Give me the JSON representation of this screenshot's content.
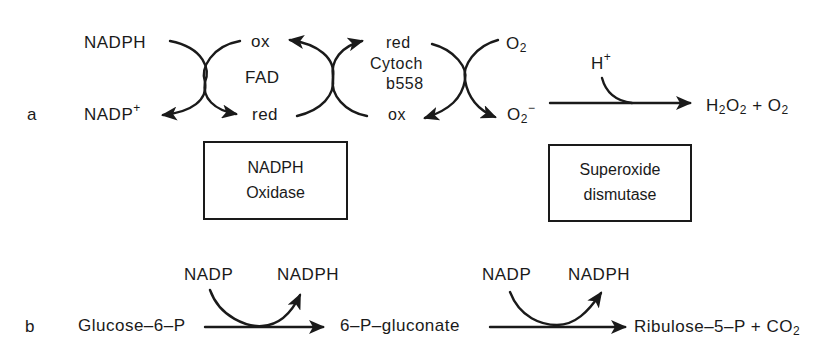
{
  "panel_a": {
    "label": "a",
    "nadph": "NADPH",
    "nadp_plus": "NADP",
    "nadp_plus_sup": "+",
    "fad": {
      "ox": "ox",
      "name": "FAD",
      "red": "red"
    },
    "cytochrome": {
      "red": "red",
      "name_line1": "Cytoch",
      "name_line2": "b558",
      "ox": "ox"
    },
    "o2": "O",
    "o2_sub": "2",
    "superoxide": "O",
    "superoxide_sub": "2",
    "superoxide_sup": "−",
    "h_plus": "H",
    "h_plus_sup": "+",
    "products": {
      "h": "H",
      "h_sub": "2",
      "o": "O",
      "o_sub": "2",
      "plus": "+",
      "o2": "O",
      "o2_sub": "2"
    },
    "enzyme_boxes": [
      {
        "line1": "NADPH",
        "line2": "Oxidase"
      },
      {
        "line1": "Superoxide",
        "line2": "dismutase"
      }
    ]
  },
  "panel_b": {
    "label": "b",
    "substrate": "Glucose–6–P",
    "step1": {
      "cofactor_in": "NADP",
      "cofactor_out": "NADPH"
    },
    "intermediate": "6–P–gluconate",
    "step2": {
      "cofactor_in": "NADP",
      "cofactor_out": "NADPH"
    },
    "product": "Ribulose–5–P + CO",
    "product_sub": "2"
  },
  "colors": {
    "ink": "#1a1a1a",
    "background": "#ffffff"
  }
}
